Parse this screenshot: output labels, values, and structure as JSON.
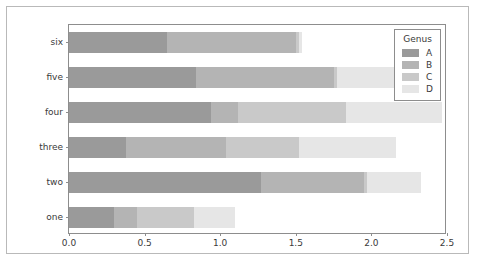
{
  "chart_data": {
    "type": "bar",
    "orientation": "horizontal",
    "stacked": true,
    "title": "",
    "xlabel": "",
    "ylabel": "",
    "xlim": [
      0.0,
      2.5
    ],
    "xticks": [
      "0.0",
      "0.5",
      "1.0",
      "1.5",
      "2.0",
      "2.5"
    ],
    "xtick_values": [
      0.0,
      0.5,
      1.0,
      1.5,
      2.0,
      2.5
    ],
    "grid": false,
    "categories": [
      "six",
      "five",
      "four",
      "three",
      "two",
      "one"
    ],
    "legend": {
      "title": "Genus",
      "position": "upper right",
      "entries": [
        "A",
        "B",
        "C",
        "D"
      ]
    },
    "colors": {
      "A": "#9a9a9a",
      "B": "#b4b4b4",
      "C": "#c9c9c9",
      "D": "#e6e6e6",
      "edge": "#8d8d8d",
      "text": "#3a3a3a",
      "background": "#ffffff"
    },
    "series": [
      {
        "name": "A",
        "color": "#9a9a9a",
        "values": [
          0.65,
          0.84,
          0.94,
          0.38,
          1.27,
          0.3
        ]
      },
      {
        "name": "B",
        "color": "#b4b4b4",
        "values": [
          0.85,
          0.91,
          0.18,
          0.66,
          0.68,
          0.15
        ]
      },
      {
        "name": "C",
        "color": "#c9c9c9",
        "values": [
          0.02,
          0.02,
          0.71,
          0.48,
          0.02,
          0.38
        ]
      },
      {
        "name": "D",
        "color": "#e6e6e6",
        "values": [
          0.02,
          0.58,
          0.64,
          0.64,
          0.36,
          0.27
        ]
      }
    ],
    "totals": [
      1.53,
      2.35,
      2.47,
      2.16,
      2.33,
      1.1
    ]
  },
  "caption": {
    "text": ""
  }
}
